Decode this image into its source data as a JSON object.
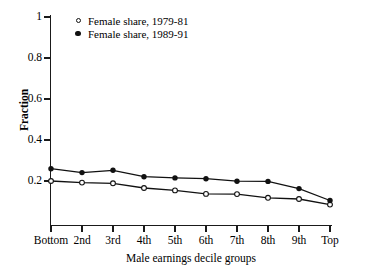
{
  "chart_data": {
    "type": "line",
    "title": "",
    "xlabel": "Male earnings decile groups",
    "ylabel": "Fraction",
    "categories": [
      "Bottom",
      "2nd",
      "3rd",
      "4th",
      "5th",
      "6th",
      "7th",
      "8th",
      "9th",
      "Top"
    ],
    "ytick_labels": [
      "0.2",
      "0.4",
      "0.6",
      "0.8",
      "1"
    ],
    "ytick_values": [
      0.2,
      0.4,
      0.6,
      0.8,
      1.0
    ],
    "ylim": [
      0.0,
      1.0
    ],
    "grid": false,
    "legend_position": "top-left",
    "series": [
      {
        "name": "Female share, 1979-81",
        "marker": "open-circle",
        "color": "#111111",
        "values": [
          0.2,
          0.192,
          0.189,
          0.166,
          0.154,
          0.137,
          0.136,
          0.118,
          0.112,
          0.085
        ]
      },
      {
        "name": "Female share, 1989-91",
        "marker": "filled-circle",
        "color": "#111111",
        "values": [
          0.26,
          0.241,
          0.252,
          0.221,
          0.215,
          0.211,
          0.199,
          0.198,
          0.163,
          0.105
        ]
      }
    ]
  },
  "legend": {
    "items": [
      {
        "label": "Female share, 1979-81",
        "marker": "open-circle"
      },
      {
        "label": "Female share, 1989-91",
        "marker": "filled-circle"
      }
    ]
  },
  "axes": {
    "y_title": "Fraction",
    "x_title": "Male earnings decile groups"
  }
}
